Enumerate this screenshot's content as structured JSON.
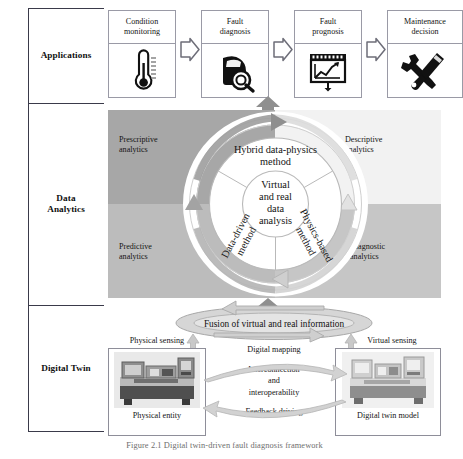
{
  "figure": {
    "caption": "Figure 2.1  Digital twin-driven fault diagnosis framework"
  },
  "rows": [
    {
      "label": "Applications"
    },
    {
      "label": "Data\nAnalytics",
      "line1": "Data",
      "line2": "Analytics"
    },
    {
      "label": "Digital Twin"
    }
  ],
  "applications": {
    "steps": [
      {
        "line1": "Condition",
        "line2": "monitoring",
        "icon": "thermometer-icon"
      },
      {
        "line1": "Fault",
        "line2": "diagnosis",
        "icon": "magnifier-car-icon"
      },
      {
        "line1": "Fault",
        "line2": "prognosis",
        "icon": "trend-chart-board-icon"
      },
      {
        "line1": "Maintenance",
        "line2": "decision",
        "icon": "wrench-screwdriver-icon"
      }
    ],
    "connector_icon": "chevron-arrow-right-icon",
    "uplink_icon": "up-arrow-icon"
  },
  "analytics": {
    "quadrants": [
      {
        "id": "prescriptive",
        "line1": "Prescriptive",
        "line2": "analytics",
        "color": "#a7a7a7"
      },
      {
        "id": "descriptive",
        "line1": "Descriptive",
        "line2": "analytics",
        "color": "#f2f2f2"
      },
      {
        "id": "predictive",
        "line1": "Predictive",
        "line2": "analytics",
        "color": "#bcbcbc"
      },
      {
        "id": "diagnostic",
        "line1": "Diagnostic",
        "line2": "analytics",
        "color": "#c6c6c6"
      }
    ],
    "wheel": {
      "core": [
        "Virtual",
        "and real",
        "data",
        "analysis"
      ],
      "sectors": [
        {
          "id": "hybrid",
          "line1": "Hybrid data-physics",
          "line2": "method"
        },
        {
          "id": "data-driven",
          "line1": "Data-driven",
          "line2": "method"
        },
        {
          "id": "physics-based",
          "line1": "Physics-based",
          "line2": "method"
        }
      ],
      "ring_arrows_icon": "circular-arrow-icon"
    }
  },
  "digital_twin": {
    "fusion_band": {
      "text": "Fusion of virtual and real information",
      "icon": "ellipse-cycle-icon"
    },
    "left": {
      "top_label": "Physical sensing",
      "caption": "Physical entity",
      "image": "cnc-lathe-machine-photo"
    },
    "right": {
      "top_label": "Virtual sensing",
      "caption": "Digital twin model",
      "image": "cnc-lathe-digital-model-photo"
    },
    "middle": {
      "top": "Digital mapping",
      "mid1": "Interconnection",
      "mid2": "and",
      "mid3": "interoperability",
      "bottom": "Feedback driving",
      "arc_top_icon": "curved-arrow-right-icon",
      "arc_bottom_icon": "curved-arrow-left-icon"
    }
  }
}
